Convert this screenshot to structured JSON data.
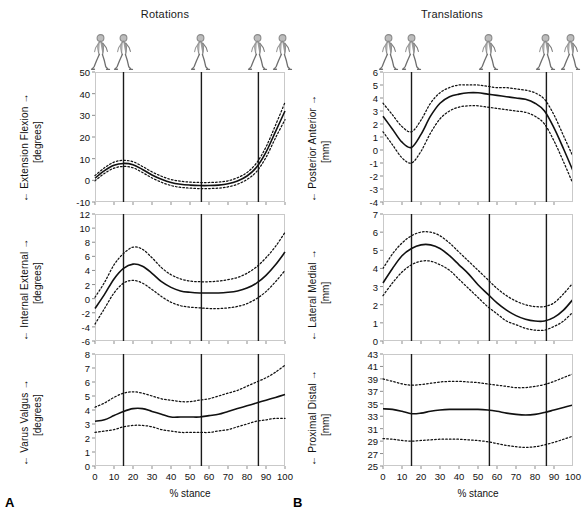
{
  "figure": {
    "panels": [
      {
        "letter": "A",
        "title": "Rotations"
      },
      {
        "letter": "B",
        "title": "Translations"
      }
    ],
    "x_axis": {
      "label": "% stance",
      "ticks": [
        0,
        10,
        20,
        30,
        40,
        50,
        60,
        70,
        80,
        90,
        100
      ],
      "min": 0,
      "max": 100
    },
    "event_lines": [
      15,
      56,
      86
    ],
    "walker_positions": [
      3,
      15,
      56,
      86,
      99
    ],
    "walker_icon": "walking-person-icon"
  },
  "chart_data": [
    {
      "type": "line",
      "panel": "A",
      "title": "Rotations",
      "name": "extension-flexion",
      "ylabel": "← Extension  Flexion →",
      "yunit": "[degrees]",
      "xlabel": "% stance",
      "ylim": [
        -10,
        50
      ],
      "yticks": [
        -10,
        0,
        10,
        20,
        30,
        40,
        50
      ],
      "xlim": [
        0,
        100
      ],
      "grid": false,
      "event_lines": [
        15,
        56,
        86
      ],
      "x": [
        0,
        5,
        10,
        15,
        20,
        25,
        30,
        35,
        40,
        45,
        50,
        55,
        60,
        65,
        70,
        75,
        80,
        85,
        90,
        95,
        100
      ],
      "series": [
        {
          "name": "mean",
          "style": "solid",
          "values": [
            1.0,
            4.5,
            7.0,
            7.8,
            7.2,
            5.0,
            2.5,
            0.5,
            -1.0,
            -1.8,
            -2.2,
            -2.4,
            -2.4,
            -2.2,
            -1.6,
            -0.3,
            2.0,
            6.0,
            13.0,
            22.5,
            32.0
          ]
        },
        {
          "name": "+1 SD",
          "style": "dotted",
          "values": [
            2.2,
            5.8,
            8.4,
            9.2,
            8.6,
            6.4,
            3.9,
            1.9,
            0.4,
            -0.4,
            -0.8,
            -1.0,
            -1.0,
            -0.8,
            -0.2,
            1.2,
            3.6,
            8.0,
            15.4,
            25.4,
            36.0
          ]
        },
        {
          "name": "-1 SD",
          "style": "dotted",
          "values": [
            -0.2,
            3.2,
            5.6,
            6.4,
            5.8,
            3.6,
            1.1,
            -0.9,
            -2.4,
            -3.2,
            -3.6,
            -3.8,
            -3.8,
            -3.6,
            -3.0,
            -1.8,
            0.4,
            4.0,
            10.6,
            19.6,
            28.0
          ]
        }
      ]
    },
    {
      "type": "line",
      "panel": "A",
      "name": "internal-external",
      "ylabel": "← Internal  External →",
      "yunit": "[degrees]",
      "xlabel": "% stance",
      "ylim": [
        -6,
        12
      ],
      "yticks": [
        -6,
        -4,
        -2,
        0,
        2,
        4,
        6,
        8,
        10,
        12
      ],
      "xlim": [
        0,
        100
      ],
      "grid": false,
      "event_lines": [
        15,
        56,
        86
      ],
      "x": [
        0,
        5,
        10,
        15,
        20,
        25,
        30,
        35,
        40,
        45,
        50,
        55,
        60,
        65,
        70,
        75,
        80,
        85,
        90,
        95,
        100
      ],
      "series": [
        {
          "name": "mean",
          "style": "solid",
          "values": [
            -1.4,
            0.6,
            2.8,
            4.3,
            4.9,
            4.6,
            3.6,
            2.4,
            1.6,
            1.1,
            0.9,
            0.8,
            0.8,
            0.8,
            0.9,
            1.1,
            1.5,
            2.2,
            3.3,
            4.8,
            6.6
          ]
        },
        {
          "name": "+1 SD",
          "style": "dotted",
          "values": [
            0.2,
            2.3,
            4.8,
            6.4,
            7.3,
            7.0,
            5.8,
            4.4,
            3.4,
            2.8,
            2.5,
            2.4,
            2.4,
            2.5,
            2.7,
            3.0,
            3.6,
            4.5,
            5.8,
            7.4,
            9.4
          ]
        },
        {
          "name": "-1 SD",
          "style": "dotted",
          "values": [
            -3.6,
            -1.4,
            0.8,
            2.2,
            2.6,
            2.2,
            1.3,
            0.3,
            -0.5,
            -1.0,
            -1.2,
            -1.3,
            -1.4,
            -1.4,
            -1.3,
            -1.1,
            -0.7,
            0.0,
            1.0,
            2.4,
            4.0
          ]
        }
      ]
    },
    {
      "type": "line",
      "panel": "A",
      "name": "varus-valgus",
      "ylabel": "← Varus  Valgus →",
      "yunit": "[degrees]",
      "xlabel": "% stance",
      "ylim": [
        0,
        8
      ],
      "yticks": [
        0,
        1,
        2,
        3,
        4,
        5,
        6,
        7,
        8
      ],
      "xlim": [
        0,
        100
      ],
      "grid": false,
      "event_lines": [
        15,
        56,
        86
      ],
      "x": [
        0,
        5,
        10,
        15,
        20,
        25,
        30,
        35,
        40,
        45,
        50,
        55,
        60,
        65,
        70,
        75,
        80,
        85,
        90,
        95,
        100
      ],
      "series": [
        {
          "name": "mean",
          "style": "solid",
          "values": [
            3.2,
            3.3,
            3.6,
            3.9,
            4.1,
            4.1,
            3.9,
            3.7,
            3.5,
            3.5,
            3.5,
            3.5,
            3.6,
            3.7,
            3.9,
            4.1,
            4.3,
            4.5,
            4.7,
            4.9,
            5.1
          ]
        },
        {
          "name": "+1 SD",
          "style": "dotted",
          "values": [
            4.2,
            4.5,
            4.9,
            5.2,
            5.3,
            5.2,
            5.0,
            4.8,
            4.7,
            4.6,
            4.6,
            4.7,
            4.8,
            5.0,
            5.2,
            5.4,
            5.7,
            6.0,
            6.3,
            6.7,
            7.2
          ]
        },
        {
          "name": "-1 SD",
          "style": "dotted",
          "values": [
            2.4,
            2.5,
            2.6,
            2.8,
            2.9,
            2.9,
            2.8,
            2.6,
            2.5,
            2.4,
            2.4,
            2.4,
            2.4,
            2.5,
            2.6,
            2.8,
            3.0,
            3.2,
            3.3,
            3.4,
            3.4
          ]
        }
      ]
    },
    {
      "type": "line",
      "panel": "B",
      "title": "Translations",
      "name": "posterior-anterior",
      "ylabel": "← Posterior  Anterior →",
      "yunit": "[mm]",
      "xlabel": "% stance",
      "ylim": [
        -4,
        6
      ],
      "yticks": [
        -4,
        -3,
        -2,
        -1,
        0,
        1,
        2,
        3,
        4,
        5,
        6
      ],
      "xlim": [
        0,
        100
      ],
      "grid": false,
      "event_lines": [
        15,
        56,
        86
      ],
      "x": [
        0,
        5,
        10,
        15,
        20,
        25,
        30,
        35,
        40,
        45,
        50,
        55,
        60,
        65,
        70,
        75,
        80,
        85,
        90,
        95,
        100
      ],
      "series": [
        {
          "name": "mean",
          "style": "solid",
          "values": [
            2.6,
            1.6,
            0.6,
            0.2,
            1.2,
            2.6,
            3.6,
            4.1,
            4.3,
            4.4,
            4.4,
            4.3,
            4.2,
            4.1,
            4.0,
            3.9,
            3.6,
            3.0,
            1.7,
            0.1,
            -1.6
          ]
        },
        {
          "name": "+1 SD",
          "style": "dotted",
          "values": [
            3.6,
            2.7,
            1.8,
            1.4,
            2.3,
            3.6,
            4.4,
            4.8,
            5.0,
            5.0,
            5.0,
            4.9,
            4.8,
            4.8,
            4.7,
            4.6,
            4.4,
            3.9,
            2.7,
            1.1,
            -0.5
          ]
        },
        {
          "name": "-1 SD",
          "style": "dotted",
          "values": [
            1.4,
            0.4,
            -0.6,
            -1.0,
            -0.1,
            1.3,
            2.4,
            3.0,
            3.3,
            3.4,
            3.4,
            3.3,
            3.2,
            3.1,
            3.0,
            2.9,
            2.6,
            2.0,
            0.7,
            -0.9,
            -2.6
          ]
        }
      ]
    },
    {
      "type": "line",
      "panel": "B",
      "name": "lateral-medial",
      "ylabel": "← Lateral  Medial →",
      "yunit": "[mm]",
      "xlabel": "% stance",
      "ylim": [
        0,
        7
      ],
      "yticks": [
        0,
        1,
        2,
        3,
        4,
        5,
        6,
        7
      ],
      "xlim": [
        0,
        100
      ],
      "grid": false,
      "event_lines": [
        15,
        56,
        86
      ],
      "x": [
        0,
        5,
        10,
        15,
        20,
        25,
        30,
        35,
        40,
        45,
        50,
        55,
        60,
        65,
        70,
        75,
        80,
        85,
        90,
        95,
        100
      ],
      "series": [
        {
          "name": "mean",
          "style": "solid",
          "values": [
            3.2,
            4.0,
            4.7,
            5.1,
            5.3,
            5.3,
            5.1,
            4.7,
            4.2,
            3.7,
            3.1,
            2.6,
            2.1,
            1.7,
            1.4,
            1.2,
            1.1,
            1.1,
            1.3,
            1.7,
            2.3
          ]
        },
        {
          "name": "+1 SD",
          "style": "dotted",
          "values": [
            4.0,
            4.8,
            5.4,
            5.8,
            6.0,
            6.0,
            5.8,
            5.4,
            4.9,
            4.4,
            3.9,
            3.4,
            2.9,
            2.5,
            2.2,
            2.0,
            1.9,
            1.9,
            2.1,
            2.6,
            3.2
          ]
        },
        {
          "name": "-1 SD",
          "style": "dotted",
          "values": [
            2.5,
            3.2,
            3.8,
            4.2,
            4.4,
            4.4,
            4.2,
            3.9,
            3.4,
            2.9,
            2.4,
            1.9,
            1.5,
            1.1,
            0.9,
            0.7,
            0.6,
            0.6,
            0.8,
            1.1,
            1.6
          ]
        }
      ]
    },
    {
      "type": "line",
      "panel": "B",
      "name": "proximal-distal",
      "ylabel": "← Proximal  Distal →",
      "yunit": "[mm]",
      "xlabel": "% stance",
      "ylim": [
        25,
        43
      ],
      "yticks": [
        25,
        27,
        29,
        31,
        33,
        35,
        37,
        39,
        41,
        43
      ],
      "xlim": [
        0,
        100
      ],
      "grid": false,
      "event_lines": [
        15,
        56,
        86
      ],
      "x": [
        0,
        5,
        10,
        15,
        20,
        25,
        30,
        35,
        40,
        45,
        50,
        55,
        60,
        65,
        70,
        75,
        80,
        85,
        90,
        95,
        100
      ],
      "series": [
        {
          "name": "mean",
          "style": "solid",
          "values": [
            34.2,
            34.1,
            33.8,
            33.4,
            33.5,
            33.8,
            34.0,
            34.1,
            34.1,
            34.1,
            34.1,
            34.0,
            33.8,
            33.5,
            33.3,
            33.2,
            33.3,
            33.6,
            34.0,
            34.4,
            34.8
          ]
        },
        {
          "name": "+1 SD",
          "style": "dotted",
          "values": [
            39.0,
            38.6,
            38.2,
            38.0,
            38.1,
            38.3,
            38.5,
            38.6,
            38.6,
            38.5,
            38.4,
            38.2,
            38.0,
            37.8,
            37.6,
            37.6,
            37.8,
            38.1,
            38.6,
            39.2,
            39.8
          ]
        },
        {
          "name": "-1 SD",
          "style": "dotted",
          "values": [
            29.4,
            29.3,
            29.1,
            29.0,
            29.1,
            29.2,
            29.3,
            29.3,
            29.3,
            29.2,
            29.1,
            28.9,
            28.6,
            28.3,
            28.1,
            28.0,
            28.1,
            28.4,
            28.8,
            29.3,
            29.8
          ]
        }
      ]
    }
  ]
}
